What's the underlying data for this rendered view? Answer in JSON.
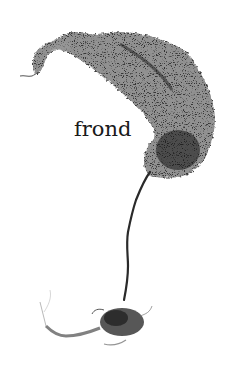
{
  "image": {
    "subject": "seaweed specimen",
    "background_color": "#ffffff",
    "frond_color": "#3a3a3a",
    "stipe_color": "#2a2a2a",
    "holdfast_color": "#4a4a4a"
  },
  "label": {
    "text": "frond"
  }
}
